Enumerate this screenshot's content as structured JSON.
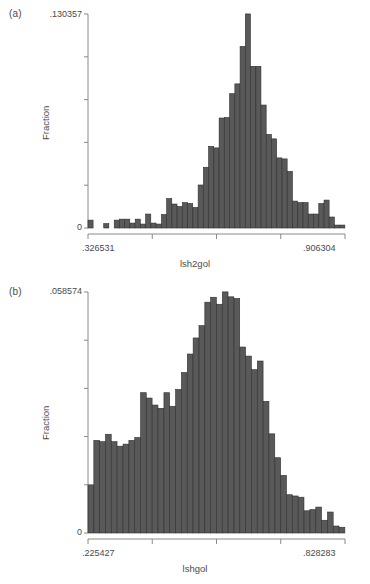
{
  "figure": {
    "background": "#ffffff",
    "bar_color": "#595959",
    "bar_edge_color": "#2e2e2e",
    "axis_color": "#8a8a8a",
    "text_color": "#4a4a4a"
  },
  "panels": [
    {
      "letter": "(a)",
      "chart_data": {
        "type": "bar",
        "title": "",
        "subtitle": "",
        "xlabel": "lsh2gol",
        "ylabel": "Fraction",
        "xlim": [
          0.326531,
          0.906304
        ],
        "ylim": [
          0,
          0.130357
        ],
        "xtick_labels": [
          ".326531",
          ".906304"
        ],
        "ytick_labels": [
          "0",
          ".130357"
        ],
        "grid": false,
        "legend": "none",
        "n_bins": 49,
        "bin_width": 0.011832,
        "categories": [
          "0.3265",
          "0.3384",
          "0.3502",
          "0.3620",
          "0.3739",
          "0.3857",
          "0.3975",
          "0.4094",
          "0.4212",
          "0.4330",
          "0.4449",
          "0.4567",
          "0.4685",
          "0.4804",
          "0.4922",
          "0.5040",
          "0.5158",
          "0.5277",
          "0.5395",
          "0.5513",
          "0.5632",
          "0.5750",
          "0.5868",
          "0.5987",
          "0.6105",
          "0.6223",
          "0.6342",
          "0.6460",
          "0.6578",
          "0.6697",
          "0.6815",
          "0.6933",
          "0.7052",
          "0.7170",
          "0.7288",
          "0.7406",
          "0.7525",
          "0.7643",
          "0.7761",
          "0.7880",
          "0.7998",
          "0.8116",
          "0.8235",
          "0.8353",
          "0.8471",
          "0.8590",
          "0.8708",
          "0.8826",
          "0.8945"
        ],
        "values": [
          0.0048,
          0.0,
          0.0,
          0.0027,
          0.0,
          0.0048,
          0.0054,
          0.0054,
          0.003,
          0.0054,
          0.0024,
          0.0085,
          0.003,
          0.0024,
          0.0082,
          0.0179,
          0.0146,
          0.0131,
          0.0155,
          0.0149,
          0.0125,
          0.0262,
          0.037,
          0.0497,
          0.0488,
          0.067,
          0.0673,
          0.0818,
          0.0878,
          0.1106,
          0.1304,
          0.0985,
          0.0985,
          0.0749,
          0.057,
          0.0543,
          0.0427,
          0.0421,
          0.0345,
          0.0164,
          0.0155,
          0.0155,
          0.0085,
          0.0085,
          0.0149,
          0.017,
          0.0067,
          0.0018,
          0.0018
        ]
      }
    },
    {
      "letter": "(b)",
      "chart_data": {
        "type": "bar",
        "title": "",
        "subtitle": "",
        "xlabel": "lshgol",
        "ylabel": "Fraction",
        "xlim": [
          0.225427,
          0.828283
        ],
        "ylim": [
          0,
          0.058574
        ],
        "xtick_labels": [
          ".225427",
          ".828283"
        ],
        "ytick_labels": [
          "0",
          ".058574"
        ],
        "grid": false,
        "legend": "none",
        "n_bins": 44,
        "bin_width": 0.013701,
        "categories": [
          "0.2254",
          "0.2391",
          "0.2528",
          "0.2665",
          "0.2802",
          "0.2939",
          "0.3076",
          "0.3213",
          "0.3351",
          "0.3488",
          "0.3625",
          "0.3762",
          "0.3899",
          "0.4036",
          "0.4173",
          "0.4310",
          "0.4447",
          "0.4584",
          "0.4721",
          "0.4858",
          "0.4995",
          "0.5132",
          "0.5269",
          "0.5406",
          "0.5543",
          "0.5680",
          "0.5818",
          "0.5955",
          "0.6092",
          "0.6229",
          "0.6366",
          "0.6503",
          "0.6640",
          "0.6777",
          "0.6914",
          "0.7051",
          "0.7188",
          "0.7325",
          "0.7462",
          "0.7599",
          "0.7736",
          "0.7873",
          "0.8010",
          "0.8147"
        ],
        "values": [
          0.0117,
          0.0225,
          0.0222,
          0.024,
          0.0222,
          0.0211,
          0.0216,
          0.0225,
          0.0232,
          0.0341,
          0.0328,
          0.0311,
          0.0303,
          0.0341,
          0.0308,
          0.0349,
          0.039,
          0.0435,
          0.0474,
          0.0504,
          0.0561,
          0.0573,
          0.0556,
          0.0586,
          0.0574,
          0.057,
          0.0452,
          0.043,
          0.0397,
          0.0418,
          0.032,
          0.0241,
          0.0183,
          0.014,
          0.0093,
          0.009,
          0.0087,
          0.0054,
          0.0057,
          0.0063,
          0.0031,
          0.0051,
          0.0017,
          0.0014
        ]
      }
    }
  ]
}
